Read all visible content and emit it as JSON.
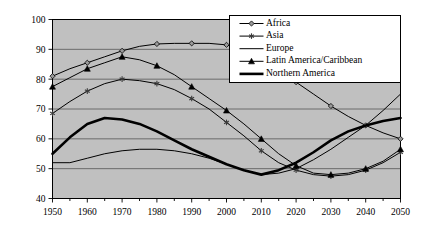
{
  "chart_data": {
    "type": "line",
    "title": "",
    "xlabel": "",
    "ylabel": "",
    "xlim": [
      1950,
      2050
    ],
    "ylim": [
      40,
      100
    ],
    "ytick_step": 10,
    "xtick_step": 10,
    "minor_xtick_step": 5,
    "grid": true,
    "grid_axis": "y",
    "plot_background": "#c0c0c0",
    "line_color": "#000000",
    "legend_position": "top-right",
    "x": [
      1950,
      1955,
      1960,
      1965,
      1970,
      1975,
      1980,
      1985,
      1990,
      1995,
      2000,
      2005,
      2010,
      2015,
      2020,
      2025,
      2030,
      2035,
      2040,
      2045,
      2050
    ],
    "xticks": [
      1950,
      1960,
      1970,
      1980,
      1990,
      2000,
      2010,
      2020,
      2030,
      2040,
      2050
    ],
    "yticks": [
      40,
      50,
      60,
      70,
      80,
      90,
      100
    ],
    "series": [
      {
        "name": "Africa",
        "marker": "diamond",
        "linewidth": 1,
        "values": [
          81,
          83.5,
          85.5,
          87.5,
          89.5,
          91,
          91.8,
          92,
          92,
          92,
          91.5,
          89.5,
          86.5,
          83,
          79,
          75,
          71,
          67.5,
          64.5,
          62,
          60
        ]
      },
      {
        "name": "Asia",
        "marker": "asterisk",
        "linewidth": 1,
        "values": [
          68.5,
          72.5,
          76,
          78.5,
          80,
          79.5,
          78.5,
          76.5,
          73.5,
          70,
          65.5,
          61,
          56,
          52,
          49.5,
          48,
          47.5,
          48,
          49.5,
          52,
          55.5
        ]
      },
      {
        "name": "Europe",
        "marker": "none",
        "linewidth": 1,
        "values": [
          52,
          52,
          53.5,
          55,
          56,
          56.5,
          56.5,
          56,
          55,
          53.5,
          51.5,
          49.5,
          48,
          48.5,
          50,
          53,
          56.5,
          60.5,
          64.5,
          69.5,
          75
        ]
      },
      {
        "name": "Latin America/Caribbean",
        "marker": "triangle",
        "linewidth": 1,
        "values": [
          77.5,
          80.5,
          83.5,
          85.5,
          87.5,
          86.5,
          84.5,
          81.5,
          77.5,
          73.5,
          69.5,
          65,
          60,
          55,
          51,
          48.5,
          48,
          48.5,
          50,
          52.5,
          56.5
        ]
      },
      {
        "name": "Northern America",
        "marker": "none",
        "linewidth": 2.6,
        "values": [
          55,
          60.5,
          65,
          67,
          66.5,
          65,
          62.5,
          59.5,
          56.5,
          54,
          51.5,
          49.5,
          48,
          49.5,
          52,
          55.5,
          59.5,
          62.5,
          64.5,
          66,
          67
        ]
      }
    ]
  },
  "legend": {
    "items": [
      {
        "label": "Africa",
        "marker": "diamond"
      },
      {
        "label": "Asia",
        "marker": "asterisk"
      },
      {
        "label": "Europe",
        "marker": "none"
      },
      {
        "label": "Latin America/Caribbean",
        "marker": "triangle"
      },
      {
        "label": "Northern America",
        "marker": "none"
      }
    ]
  }
}
